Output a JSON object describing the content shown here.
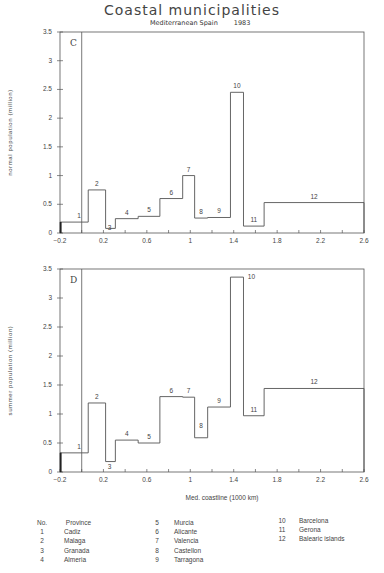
{
  "title": "Coastal municipalities",
  "subtitle": {
    "region": "Mediterranean Spain",
    "year": "1983"
  },
  "legend": {
    "header": {
      "no": "No.",
      "name": "Province"
    },
    "columns": [
      [
        {
          "no": "1",
          "name": "Cadiz"
        },
        {
          "no": "2",
          "name": "Malaga"
        },
        {
          "no": "3",
          "name": "Granada"
        },
        {
          "no": "4",
          "name": "Almeria"
        }
      ],
      [
        {
          "no": "5",
          "name": "Murcia"
        },
        {
          "no": "6",
          "name": "Alicante"
        },
        {
          "no": "7",
          "name": "Valencia"
        },
        {
          "no": "8",
          "name": "Castellon"
        },
        {
          "no": "9",
          "name": "Tarragona"
        }
      ],
      [
        {
          "no": "10",
          "name": "Barcelona"
        },
        {
          "no": "11",
          "name": "Gerona"
        },
        {
          "no": "12",
          "name": "Balearic islands"
        }
      ]
    ]
  },
  "chart_data": [
    {
      "type": "bar",
      "subtype": "step/variable-width bar",
      "panel": "C",
      "title": "Coastal municipalities",
      "subtitle": "Mediterranean Spain 1983",
      "xlabel": "",
      "ylabel": "normal population (million)",
      "xlim": [
        -0.2,
        2.6
      ],
      "ylim": [
        0,
        3.5
      ],
      "xticks": [
        "-0.2",
        "0.2",
        "0.6",
        "1",
        "1.4",
        "1.8",
        "2.2",
        "2.6"
      ],
      "yticks": [
        "0",
        "0.5",
        "1",
        "1.5",
        "2",
        "2.5",
        "3",
        "3.5"
      ],
      "reference_line_x": 0.0,
      "categories": [
        "1",
        "2",
        "3",
        "4",
        "5",
        "6",
        "7",
        "8",
        "9",
        "10",
        "11",
        "12"
      ],
      "x_edges": [
        -0.2,
        0.06,
        0.22,
        0.31,
        0.52,
        0.72,
        0.93,
        1.04,
        1.16,
        1.37,
        1.49,
        1.68,
        2.6
      ],
      "values": [
        0.19,
        0.75,
        0.08,
        0.25,
        0.29,
        0.6,
        1.0,
        0.26,
        0.27,
        2.45,
        0.12,
        0.53
      ],
      "grid": false
    },
    {
      "type": "bar",
      "subtype": "step/variable-width bar",
      "panel": "D",
      "xlabel": "Med. coastline (1000 km)",
      "ylabel": "summer population (million)",
      "xlim": [
        -0.2,
        2.6
      ],
      "ylim": [
        0,
        3.5
      ],
      "xticks": [
        "-0.2",
        "0.2",
        "0.6",
        "1",
        "1.4",
        "1.8",
        "2.2",
        "2.6"
      ],
      "yticks": [
        "0",
        "0.5",
        "1",
        "1.5",
        "2",
        "2.5",
        "3",
        "3.5"
      ],
      "reference_line_x": 0.0,
      "categories": [
        "1",
        "2",
        "3",
        "4",
        "5",
        "6",
        "7",
        "8",
        "9",
        "10",
        "11",
        "12"
      ],
      "x_edges": [
        -0.2,
        0.06,
        0.22,
        0.31,
        0.52,
        0.72,
        0.93,
        1.04,
        1.16,
        1.37,
        1.49,
        1.68,
        2.6
      ],
      "values": [
        0.33,
        1.19,
        0.18,
        0.55,
        0.5,
        1.3,
        1.29,
        0.59,
        1.12,
        3.36,
        0.97,
        1.44
      ],
      "grid": false
    }
  ],
  "colors": {
    "line": "#555555",
    "text": "#444444",
    "background": "#ffffff"
  }
}
